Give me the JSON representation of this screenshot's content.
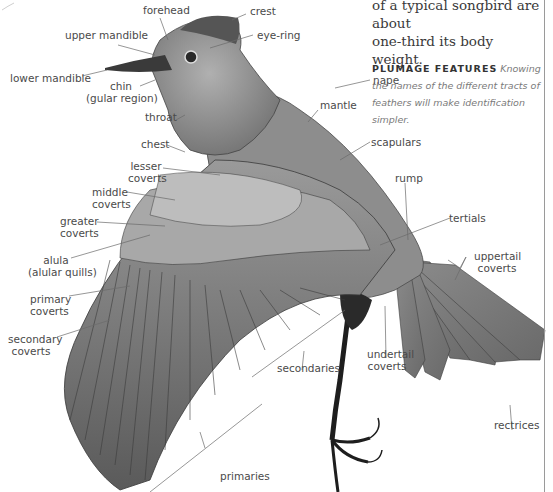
{
  "intro": {
    "line1": "of a typical songbird are about",
    "line2": "one-third its body weight."
  },
  "plumage": {
    "heading": "PLUMAGE FEATURES",
    "text": "Knowing the names of the different tracts of feathers will make identification simpler."
  },
  "labels": {
    "forehead": "forehead",
    "crest": "crest",
    "upper_mandible": "upper mandible",
    "eye_ring": "eye-ring",
    "lower_mandible": "lower mandible",
    "chin": "chin",
    "chin_sub": "(gular region)",
    "nape": "nape",
    "mantle": "mantle",
    "throat": "throat",
    "chest": "chest",
    "scapulars": "scapulars",
    "lesser_coverts_1": "lesser",
    "lesser_coverts_2": "coverts",
    "middle_coverts_1": "middle",
    "middle_coverts_2": "coverts",
    "rump": "rump",
    "greater_coverts_1": "greater",
    "greater_coverts_2": "coverts",
    "tertials": "tertials",
    "alula_1": "alula",
    "alula_2": "(alular quills)",
    "uppertail_coverts_1": "uppertail",
    "uppertail_coverts_2": "coverts",
    "primary_coverts_1": "primary",
    "primary_coverts_2": "coverts",
    "secondary_coverts_1": "secondary",
    "secondary_coverts_2": "coverts",
    "undertail_coverts_1": "undertail",
    "undertail_coverts_2": "coverts",
    "secondaries": "secondaries",
    "rectrices": "rectrices",
    "primaries": "primaries"
  },
  "colors": {
    "label_text": "#4a4a4a",
    "leader_line": "#6a6a6a",
    "heading": "#333333",
    "border": "#9a9a9a"
  }
}
